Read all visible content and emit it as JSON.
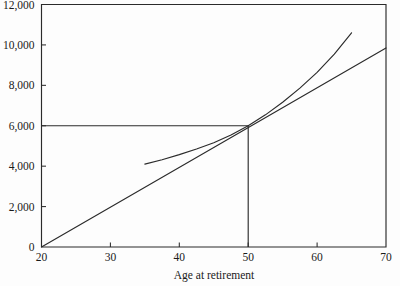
{
  "chart_data": {
    "type": "line",
    "title": "",
    "subtitle": "",
    "xlabel": "Age at retirement",
    "ylabel": "",
    "xlim": [
      20,
      70
    ],
    "ylim": [
      0,
      12000
    ],
    "grid": false,
    "legend": "none",
    "x_ticks": [
      20,
      30,
      40,
      50,
      60,
      70
    ],
    "x_tick_labels": [
      "20",
      "30",
      "40",
      "50",
      "60",
      "70"
    ],
    "y_ticks": [
      0,
      2000,
      4000,
      6000,
      8000,
      10000,
      12000
    ],
    "y_tick_labels": [
      "0",
      "2,000",
      "4,000",
      "6,000",
      "8,000",
      "10,000",
      "12,000"
    ],
    "series": [
      {
        "name": "straight-line-accrual",
        "style": "straight",
        "x": [
          20,
          70
        ],
        "values": [
          0,
          9850
        ]
      },
      {
        "name": "actual-benefit-curve",
        "style": "convex-curve",
        "x": [
          35,
          37.5,
          40,
          42.5,
          45,
          47.5,
          50,
          52.5,
          55,
          57.5,
          60,
          62.5,
          65
        ],
        "values": [
          4100,
          4320,
          4570,
          4850,
          5160,
          5540,
          6000,
          6540,
          7160,
          7860,
          8640,
          9540,
          10600
        ]
      }
    ],
    "annotations": [
      {
        "name": "reference-horizontal-6000",
        "type": "horizontal-line",
        "y": 6000,
        "x_from": 20,
        "x_to": 50
      },
      {
        "name": "reference-vertical-age-50",
        "type": "vertical-line",
        "x": 50,
        "y_from": 0,
        "y_to": 6000
      }
    ],
    "colors": {
      "line": "#2b2b2b",
      "axis": "#2b2b2b",
      "background": "#fdfdfd",
      "text": "#1a1a1a"
    }
  },
  "axis_titles": {
    "x": "Age at retirement"
  }
}
